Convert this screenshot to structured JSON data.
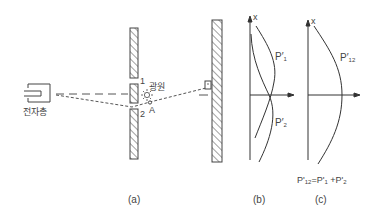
{
  "panels": {
    "a": {
      "caption": "(a)",
      "electron_gun_label": "전자총",
      "light_source_label": "광원",
      "slit_1_label": "1",
      "slit_2_label": "2",
      "point_label": "A",
      "light_source_icon": "sun-icon"
    },
    "b": {
      "caption": "(b)",
      "axis_label": "x",
      "curve_1": {
        "base": "P",
        "prime": "′",
        "sub": "1"
      },
      "curve_2": {
        "base": "P",
        "prime": "′",
        "sub": "2"
      }
    },
    "c": {
      "caption": "(c)",
      "axis_label": "x",
      "curve": {
        "base": "P",
        "prime": "′",
        "sub": "12"
      },
      "equation": {
        "lhs_base": "P'",
        "lhs_sub": "12",
        "eq": "=",
        "t1_base": "P'",
        "t1_sub": "1",
        "plus": "+",
        "t2_base": "P'",
        "t2_sub": "2"
      }
    }
  },
  "colors": {
    "line": "#333333",
    "text": "#444444",
    "background": "#ffffff"
  }
}
